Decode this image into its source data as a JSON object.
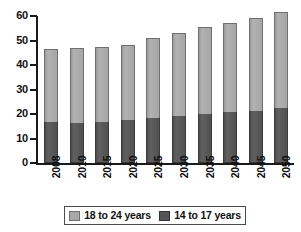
{
  "chart_data": {
    "type": "bar",
    "subtype": "stacked-bar",
    "title": "",
    "xlabel": "",
    "ylabel": "",
    "categories": [
      "2008",
      "2010",
      "2015",
      "2020",
      "2025",
      "2030",
      "2035",
      "2040",
      "2045",
      "2050"
    ],
    "series": [
      {
        "name": "14 to 17 years",
        "color": "#555555",
        "values": [
          16.8,
          16.4,
          16.6,
          17.7,
          18.5,
          19.3,
          19.9,
          20.8,
          21.4,
          22.3
        ]
      },
      {
        "name": "18 to 24 years",
        "color": "#a8a8a8",
        "values": [
          29.7,
          30.7,
          30.8,
          30.5,
          32.5,
          33.9,
          35.8,
          36.5,
          37.9,
          39.2
        ]
      }
    ],
    "totals": [
      46.5,
      47.1,
      47.4,
      48.2,
      51.0,
      53.2,
      55.7,
      57.3,
      59.3,
      61.5
    ],
    "ylim": [
      0,
      60
    ],
    "ytick_values": [
      0,
      10,
      20,
      30,
      40,
      50,
      60
    ],
    "ytick_labels": [
      "0",
      "10",
      "20",
      "30",
      "40",
      "50",
      "60"
    ],
    "grid": false,
    "legend_position": "bottom",
    "legend_order": [
      "18 to 24 years",
      "14 to 17 years"
    ],
    "stack_order_bottom_to_top": [
      "14 to 17 years",
      "18 to 24 years"
    ],
    "x_tick_label_rotation": 90
  },
  "legend": {
    "entries": [
      {
        "label": "18 to 24 years",
        "swatch": "light-gray-swatch"
      },
      {
        "label": "14 to 17 years",
        "swatch": "dark-gray-swatch"
      }
    ]
  }
}
